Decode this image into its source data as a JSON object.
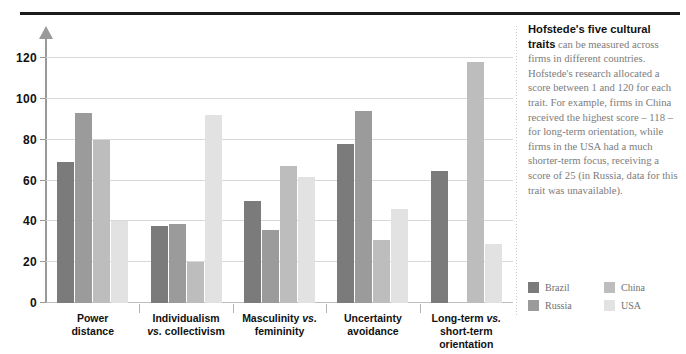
{
  "chart_data": {
    "type": "bar",
    "title": "",
    "xlabel": "",
    "ylabel": "",
    "ylim": [
      0,
      130
    ],
    "yticks": [
      0,
      20,
      40,
      60,
      80,
      100,
      120
    ],
    "grid": true,
    "legend_position": "right",
    "categories": [
      "Power distance",
      "Individualism vs. collectivism",
      "Masculinity vs. femininity",
      "Uncertainty avoidance",
      "Long-term vs. short-term orientation"
    ],
    "series": [
      {
        "name": "Brazil",
        "color": "#7b7b7b",
        "values": [
          69,
          38,
          50,
          78,
          65
        ]
      },
      {
        "name": "Russia",
        "color": "#9b9b9b",
        "values": [
          93,
          39,
          36,
          94,
          null
        ]
      },
      {
        "name": "China",
        "color": "#bdbdbd",
        "values": [
          80,
          20,
          67,
          31,
          118
        ]
      },
      {
        "name": "USA",
        "color": "#e2e2e2",
        "values": [
          40,
          92,
          62,
          46,
          29
        ]
      }
    ]
  },
  "categories_display": [
    {
      "line1": "Power",
      "line2": "distance",
      "line3": "",
      "italic1": "",
      "italic2": ""
    },
    {
      "line1": "Individualism",
      "line2": "vs. collectivism",
      "line3": ""
    },
    {
      "line1": "Masculinity vs.",
      "line2": "femininity",
      "line3": ""
    },
    {
      "line1": "Uncertainty",
      "line2": "avoidance",
      "line3": ""
    },
    {
      "line1": "Long-term vs.",
      "line2": "short-term",
      "line3": "orientation"
    }
  ],
  "yticks": [
    "0",
    "20",
    "40",
    "60",
    "80",
    "100",
    "120"
  ],
  "sidebar": {
    "blurb_bold": "Hofstede's five cultural traits",
    "blurb_rest": " can be measured across firms in different countries. Hofstede's research allocated a score between 1 and 120 for each trait. For example, firms in China received the highest score – 118 – for long-term orientation, while firms in the USA had a much shorter-term focus, receiving a score of 25 (in Russia, data for this trait was unavailable)."
  },
  "legend": [
    {
      "label": "Brazil",
      "color": "#7b7b7b"
    },
    {
      "label": "China",
      "color": "#bdbdbd"
    },
    {
      "label": "Russia",
      "color": "#9b9b9b"
    },
    {
      "label": "USA",
      "color": "#e2e2e2"
    }
  ]
}
